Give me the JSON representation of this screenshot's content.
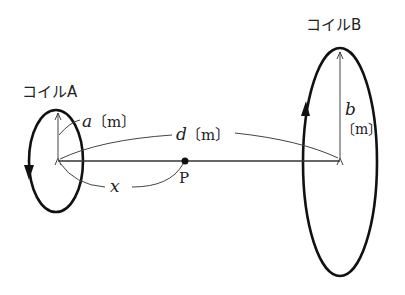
{
  "coil_a": {
    "label": "コイルA",
    "radius_label_var": "a",
    "radius_label_unit": "〔m〕"
  },
  "coil_b": {
    "label": "コイルB",
    "radius_label_var": "b",
    "radius_label_unit": "〔m〕"
  },
  "distance": {
    "var": "d",
    "unit": "〔m〕"
  },
  "point": {
    "label": "P",
    "distance_var": "x"
  }
}
